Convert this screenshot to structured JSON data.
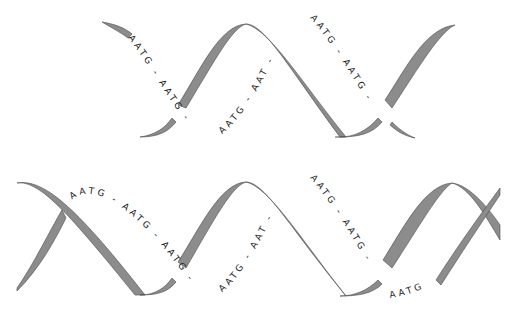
{
  "diagram": {
    "colors": {
      "ribbon_fill": "#8c8c8c",
      "ribbon_outline": "#4a4a4a",
      "text": "#222222",
      "background": "#ffffff"
    },
    "top_helix": {
      "label_segments": [
        "AATG - AATG -",
        "AATG - AAT -",
        "AATG - AATG -"
      ]
    },
    "bottom_helix": {
      "label_segments": [
        "AATG - AATG - AATG -",
        "AATG - AAT -",
        "AATG - AATG -",
        "AATG"
      ]
    }
  }
}
